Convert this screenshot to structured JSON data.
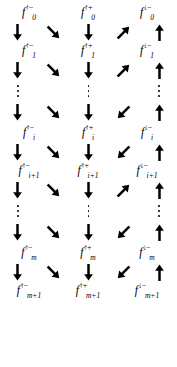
{
  "figure": {
    "type": "lattice-transition-diagram",
    "ink_color": "#000000",
    "background_color": "#ffffff",
    "columns": 5,
    "label_columns": 3,
    "label_symbol": "f",
    "superscripts": [
      "↑−",
      "↑+",
      "↓−"
    ],
    "arrow_glyphs": {
      "down": "↓",
      "down-right": "↘",
      "up-right": "↗",
      "down-left": "↙",
      "up": "↑"
    },
    "ellipsis_glyph": "⋮",
    "label_rows": [
      {
        "name": "row-0",
        "subscript": "0",
        "cells": [
          {
            "sym": "f",
            "sup": "↑−",
            "sub": "0"
          },
          {
            "sym": "f",
            "sup": "↑+",
            "sub": "0"
          },
          {
            "sym": "f",
            "sup": "↓−",
            "sub": "0"
          }
        ]
      },
      {
        "name": "row-1",
        "subscript": "1",
        "cells": [
          {
            "sym": "f",
            "sup": "↑−",
            "sub": "1"
          },
          {
            "sym": "f",
            "sup": "↑+",
            "sub": "1"
          },
          {
            "sym": "f",
            "sup": "↓−",
            "sub": "1"
          }
        ]
      },
      {
        "name": "row-i",
        "subscript": "i",
        "cells": [
          {
            "sym": "f",
            "sup": "↑−",
            "sub": "i"
          },
          {
            "sym": "f",
            "sup": "↑+",
            "sub": "i"
          },
          {
            "sym": "f",
            "sup": "↓−",
            "sub": "i"
          }
        ]
      },
      {
        "name": "row-i-plus-1",
        "subscript": "i+1",
        "cells": [
          {
            "sym": "f",
            "sup": "↑−",
            "sub": "i+1"
          },
          {
            "sym": "f",
            "sup": "↑+",
            "sub": "i+1"
          },
          {
            "sym": "f",
            "sup": "↓−",
            "sub": "i+1"
          }
        ]
      },
      {
        "name": "row-m",
        "subscript": "m",
        "cells": [
          {
            "sym": "f",
            "sup": "↑−",
            "sub": "m"
          },
          {
            "sym": "f",
            "sup": "↑+",
            "sub": "m"
          },
          {
            "sym": "f",
            "sup": "↓−",
            "sub": "m"
          }
        ]
      },
      {
        "name": "row-m-plus-1",
        "subscript": "m+1",
        "cells": [
          {
            "sym": "f",
            "sup": "↑−",
            "sub": "m+1"
          },
          {
            "sym": "f",
            "sup": "↑+",
            "sub": "m+1"
          },
          {
            "sym": "f",
            "sup": "↓−",
            "sub": "m+1"
          }
        ]
      }
    ],
    "arrow_rows": [
      {
        "name": "arrows-0-to-1",
        "dirs": [
          "down",
          "down-right",
          "down",
          "up-right",
          "up"
        ]
      },
      {
        "name": "arrows-1-to-dots-a",
        "dirs": [
          "down",
          "down-right",
          "down",
          "up-right",
          "up"
        ]
      },
      {
        "name": "arrows-dots-a-to-i",
        "dirs": [
          "down",
          "down-right",
          "down",
          "down-left",
          "up"
        ]
      },
      {
        "name": "arrows-i-to-i-plus-1",
        "dirs": [
          "down",
          "down-right",
          "down",
          "down-left",
          "up"
        ]
      },
      {
        "name": "arrows-i-plus-1-to-dots-b",
        "dirs": [
          "down",
          "down-right",
          "down",
          "up-right",
          "up"
        ]
      },
      {
        "name": "arrows-dots-b-to-m",
        "dirs": [
          "down",
          "down-right",
          "down",
          "down-left",
          "up"
        ]
      },
      {
        "name": "arrows-m-to-m-plus-1",
        "dirs": [
          "down",
          "down-right",
          "down",
          "down-left",
          "up"
        ]
      }
    ],
    "ellipsis_rows": [
      {
        "name": "ellipsis-block-a",
        "columns": [
          true,
          false,
          true,
          false,
          true
        ]
      },
      {
        "name": "ellipsis-block-b",
        "columns": [
          true,
          false,
          true,
          false,
          true
        ]
      }
    ]
  }
}
